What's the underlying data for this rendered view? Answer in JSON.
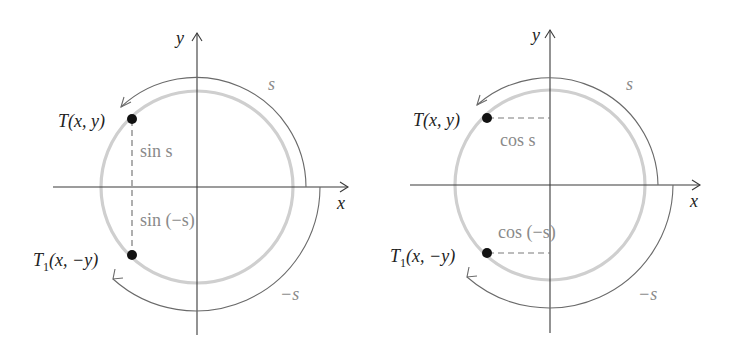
{
  "diagrams": [
    {
      "id": "sine",
      "center": [
        197,
        187
      ],
      "circle_radius": 96,
      "axis_labels": {
        "x": "x",
        "y": "y"
      },
      "points": [
        {
          "name": "T",
          "label_main": "T",
          "label_sub": "",
          "label_rest": "(x, y)"
        },
        {
          "name": "T1",
          "label_main": "T",
          "label_sub": "1",
          "label_rest": "(x, −y)"
        }
      ],
      "segment_labels": {
        "upper": "sin s",
        "lower": "sin (−s)"
      },
      "arc_labels": {
        "positive": "s",
        "negative": "−s"
      }
    },
    {
      "id": "cosine",
      "center": [
        550,
        185
      ],
      "circle_radius": 96,
      "axis_labels": {
        "x": "x",
        "y": "y"
      },
      "points": [
        {
          "name": "T",
          "label_main": "T",
          "label_sub": "",
          "label_rest": "(x, y)"
        },
        {
          "name": "T1",
          "label_main": "T",
          "label_sub": "1",
          "label_rest": "(x, −y)"
        }
      ],
      "segment_labels": {
        "upper": "cos s",
        "lower": "cos (−s)"
      },
      "arc_labels": {
        "positive": "s",
        "negative": "−s"
      }
    }
  ],
  "colors": {
    "axis": "#3a3a3a",
    "unit_circle": "#cfcfcf",
    "arc": "#6a6a6a",
    "point": "#111111",
    "gray_text": "#8a8a8a"
  }
}
